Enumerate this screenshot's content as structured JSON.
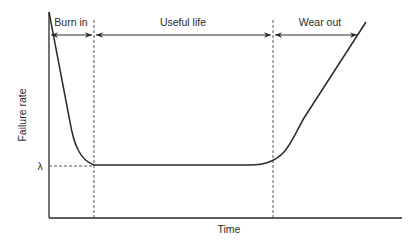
{
  "diagram": {
    "y_axis_label": "Failure rate",
    "x_axis_label": "Time",
    "lambda_label": "λ",
    "phases": [
      {
        "label": "Burn in"
      },
      {
        "label": "Useful life"
      },
      {
        "label": "Wear out"
      }
    ],
    "colors": {
      "line": "#2a2a2a",
      "background": "#ffffff"
    }
  }
}
